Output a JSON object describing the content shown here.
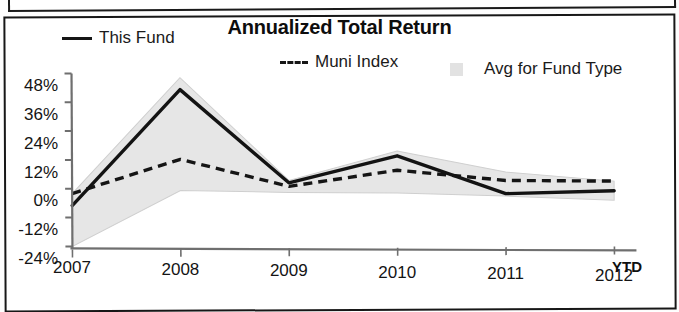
{
  "panel": {
    "title": "Annualized Total Return"
  },
  "legend": {
    "position": "top",
    "items": [
      {
        "label": "This Fund",
        "marker": "solid-line-swatch",
        "color": "#161616"
      },
      {
        "label": "Muni Index",
        "marker": "dashed-line-swatch",
        "color": "#161616"
      },
      {
        "label": "Avg for Fund Type",
        "marker": "shaded-band-swatch",
        "color": "#e2e2e2"
      }
    ]
  },
  "axis_note": "YTD",
  "chart_data": {
    "type": "line",
    "title": "Annualized Total Return",
    "xlabel": "",
    "ylabel": "",
    "x": [
      "2007",
      "2008",
      "2009",
      "2010",
      "2011",
      "2012"
    ],
    "categories": [
      "2007",
      "2008",
      "2009",
      "2010",
      "2011",
      "2012"
    ],
    "xtick_labels": [
      "2007",
      "2008",
      "2009",
      "2010",
      "2011",
      "2012"
    ],
    "ytick_labels": [
      "48%",
      "36%",
      "24%",
      "12%",
      "0%",
      "-12%",
      "-24%"
    ],
    "ytick_values": [
      48,
      36,
      24,
      12,
      0,
      -12,
      -24
    ],
    "ylim": [
      -24,
      48
    ],
    "grid": false,
    "series": [
      {
        "name": "This Fund",
        "style": "solid",
        "color": "#161616",
        "values": [
          -7,
          41,
          2,
          13,
          -3,
          -2
        ]
      },
      {
        "name": "Muni Index",
        "style": "dashed",
        "color": "#161616",
        "values": [
          -2,
          12,
          0.5,
          7,
          2.5,
          2
        ]
      },
      {
        "name": "Avg for Fund Type",
        "style": "band",
        "color": "#e2e2e2",
        "upper": [
          -2,
          46,
          3,
          15,
          6,
          2
        ],
        "lower": [
          -24,
          -1,
          -2,
          -2.5,
          -4,
          -6
        ]
      }
    ],
    "annotations": [
      {
        "text": "YTD",
        "near": "2012",
        "bold": true
      }
    ]
  }
}
